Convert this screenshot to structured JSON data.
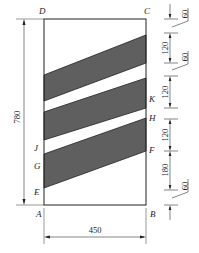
{
  "diagram": {
    "type": "dimensioned-rectangle-with-diagonal-bands",
    "colors": {
      "band_fill": "#5f5f5f",
      "line": "#222222",
      "background": "#ffffff"
    },
    "points": {
      "A": "A",
      "B": "B",
      "C": "C",
      "D": "D",
      "E": "E",
      "F": "F",
      "G": "G",
      "H": "H",
      "J": "J",
      "K": "K"
    },
    "dimensions": {
      "height": "780",
      "width": "450",
      "right_chain": [
        "60",
        "120",
        "60",
        "120",
        "120",
        "180",
        "60"
      ]
    }
  }
}
